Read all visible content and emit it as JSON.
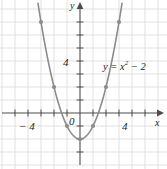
{
  "figure": {
    "type": "coordinate-graph",
    "background_color": "#ffffff",
    "grid_color": "#d9d9d9",
    "axis_color": "#4d4d4d",
    "curve_color": "#8c8c8c",
    "point_color": "#8c8c8c",
    "text_color": "#231f20"
  },
  "axes": {
    "x_axis_name": "x",
    "y_axis_name": "y",
    "origin_label": "0",
    "x_ticks": [
      {
        "value": -4,
        "label": "− 4"
      },
      {
        "value": 4,
        "label": "4"
      }
    ],
    "y_ticks": [
      {
        "value": 4,
        "label": "4"
      }
    ],
    "xlim": [
      -6.1,
      6.6
    ],
    "ylim": [
      -4.3,
      8.7
    ],
    "tick_interval": 1,
    "grid": true
  },
  "chart_data": {
    "type": "line",
    "title": "",
    "xlabel": "x",
    "ylabel": "y",
    "equation": "y = x² − 2",
    "equation_base": "y = x",
    "equation_exponent": "2",
    "equation_tail": " − 2",
    "xlim": [
      -6.1,
      6.6
    ],
    "ylim": [
      -4.3,
      8.7
    ],
    "grid": true,
    "legend": "none",
    "series": [
      {
        "name": "y = x² − 2",
        "x": [
          -3.2,
          -3.0,
          -2.5,
          -2.0,
          -1.5,
          -1.0,
          -0.5,
          0.0,
          0.5,
          1.0,
          1.5,
          2.0,
          2.5,
          3.0,
          3.2
        ],
        "y": [
          8.24,
          7.0,
          4.25,
          2.0,
          0.25,
          -1.0,
          -1.75,
          -2.0,
          -1.75,
          -1.0,
          0.25,
          2.0,
          4.25,
          7.0,
          8.24
        ]
      }
    ],
    "marked_points": [
      {
        "x": -3,
        "y": 7
      },
      {
        "x": -2,
        "y": 2
      },
      {
        "x": -1,
        "y": -1
      },
      {
        "x": 0,
        "y": -2
      },
      {
        "x": 1,
        "y": -1
      },
      {
        "x": 2,
        "y": 2
      },
      {
        "x": 3,
        "y": 7
      }
    ],
    "vertex": {
      "x": 0,
      "y": -2
    },
    "roots": [
      -1.414,
      1.414
    ]
  }
}
